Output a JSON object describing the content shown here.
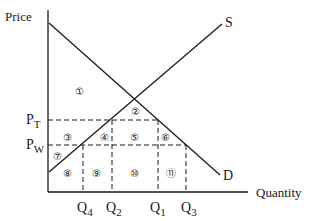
{
  "diagram": {
    "axes": {
      "y_label": "Price",
      "x_label": "Quantity"
    },
    "curves": {
      "supply_label": "S",
      "demand_label": "D"
    },
    "price_levels": [
      {
        "main": "P",
        "sub": "T"
      },
      {
        "main": "P",
        "sub": "W"
      }
    ],
    "quantity_levels": [
      {
        "main": "Q",
        "sub": "4"
      },
      {
        "main": "Q",
        "sub": "2"
      },
      {
        "main": "Q",
        "sub": "1"
      },
      {
        "main": "Q",
        "sub": "3"
      }
    ],
    "regions": [
      "①",
      "②",
      "③",
      "④",
      "⑤",
      "⑥",
      "⑦",
      "⑧",
      "⑨",
      "⑩",
      "⑪"
    ],
    "colors": {
      "line": "#1a1a1a",
      "background": "#ffffff"
    }
  }
}
